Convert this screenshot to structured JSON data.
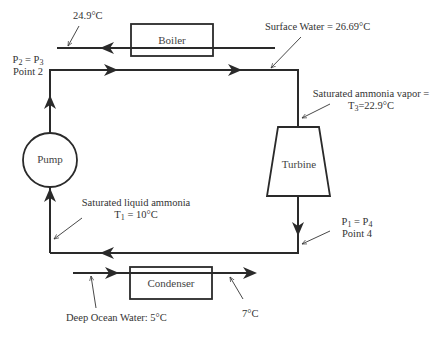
{
  "diagram": {
    "type": "ocean thermal energy conversion (closed Rankine ammonia cycle)",
    "colors": {
      "line": "#2a2a2a",
      "text": "#333333",
      "background": "#ffffff"
    },
    "components": {
      "boiler": "Boiler",
      "turbine": "Turbine",
      "condenser": "Condenser",
      "pump": "Pump"
    },
    "labels": {
      "boiler_outlet_temp": "24.9°C",
      "surface_water": "Surface Water = 26.69°C",
      "sat_vapor_line1": "Saturated ammonia vapor =",
      "sat_vapor_T": "T",
      "sat_vapor_T_sub": "3",
      "sat_vapor_T_val": "=22.9°C",
      "point2_P_a": "P",
      "point2_P_a_sub": "2",
      "point2_eq": " = P",
      "point2_P_b_sub": "3",
      "point2_name": "Point 2",
      "point4_P_a": "P",
      "point4_P_a_sub": "1",
      "point4_eq": " = P",
      "point4_P_b_sub": "4",
      "point4_name": "Point 4",
      "sat_liquid_line1": "Saturated liquid ammonia",
      "sat_liquid_T": "T",
      "sat_liquid_T_sub": "1",
      "sat_liquid_T_val": " = 10°C",
      "deep_ocean_water": "Deep Ocean Water: 5°C",
      "condenser_outlet_temp": "7°C"
    }
  }
}
